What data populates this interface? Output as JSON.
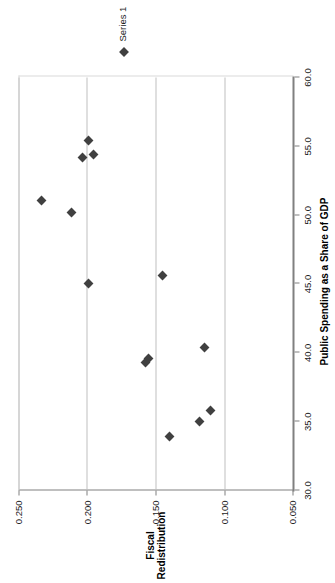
{
  "chart_data": {
    "type": "scatter",
    "title": "",
    "xlabel": "Public Spending as a Share of GDP",
    "ylabel_line1": "Fiscal",
    "ylabel_line2": "Redistribution",
    "xlim": [
      30.0,
      60.0
    ],
    "ylim": [
      0.05,
      0.25
    ],
    "xticks": [
      "30.0",
      "35.0",
      "40.0",
      "45.0",
      "50.0",
      "55.0",
      "60.0"
    ],
    "xtick_values": [
      30.0,
      35.0,
      40.0,
      45.0,
      50.0,
      55.0,
      60.0
    ],
    "yticks": [
      "0.050",
      "0.100",
      "0.150",
      "0.200",
      "0.250"
    ],
    "ytick_values": [
      0.05,
      0.1,
      0.15,
      0.2,
      0.25
    ],
    "grid": "horizontal",
    "legend_position": "right",
    "legend": [
      "Series 1"
    ],
    "marker": "diamond",
    "marker_color": "#404040",
    "axis_color": "#808080",
    "grid_color": "#bfbfbf",
    "series": [
      {
        "name": "Series 1",
        "points": [
          {
            "x": 33.9,
            "y": 0.14
          },
          {
            "x": 35.0,
            "y": 0.118
          },
          {
            "x": 35.8,
            "y": 0.11
          },
          {
            "x": 39.3,
            "y": 0.157
          },
          {
            "x": 39.6,
            "y": 0.155
          },
          {
            "x": 40.4,
            "y": 0.114
          },
          {
            "x": 45.0,
            "y": 0.199
          },
          {
            "x": 45.6,
            "y": 0.145
          },
          {
            "x": 50.2,
            "y": 0.211
          },
          {
            "x": 51.1,
            "y": 0.233
          },
          {
            "x": 54.2,
            "y": 0.203
          },
          {
            "x": 54.4,
            "y": 0.195
          },
          {
            "x": 55.4,
            "y": 0.199
          }
        ]
      }
    ]
  },
  "axes": {
    "x_title": "Public Spending as a Share of GDP",
    "y_title_line1": "Fiscal",
    "y_title_line2": "Redistribution"
  },
  "legend": {
    "series_1_label": "Series 1"
  }
}
